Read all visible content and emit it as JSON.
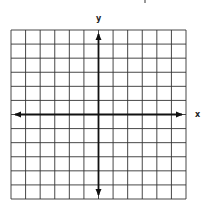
{
  "diagram": {
    "type": "coordinate-plane",
    "x_axis_label": "x",
    "y_axis_label": "y",
    "grid": {
      "columns": 12,
      "rows": 12,
      "left": 11,
      "top": 30,
      "right": 186,
      "bottom": 199
    },
    "axis_position": {
      "column_index": 6,
      "row_index": 6
    },
    "colors": {
      "grid": "#333333",
      "axis": "#111111",
      "background": "#ffffff"
    }
  }
}
